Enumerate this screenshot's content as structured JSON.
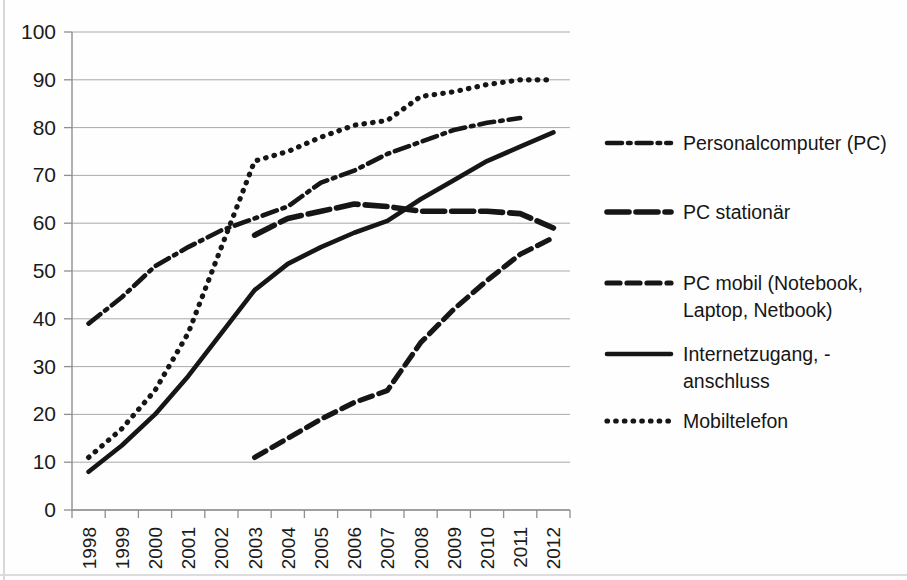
{
  "chart_data": {
    "type": "line",
    "title": "",
    "subtitle": "",
    "xlabel": "",
    "ylabel": "",
    "ylim": [
      0,
      100
    ],
    "ytick_labels": [
      "0",
      "10",
      "20",
      "30",
      "40",
      "50",
      "60",
      "70",
      "80",
      "90",
      "100"
    ],
    "ytick_values": [
      0,
      10,
      20,
      30,
      40,
      50,
      60,
      70,
      80,
      90,
      100
    ],
    "grid": true,
    "grid_axis": "y",
    "legend_position": "right",
    "categories": [
      "1998",
      "1999",
      "2000",
      "2001",
      "2002",
      "2003",
      "2004",
      "2005",
      "2006",
      "2007",
      "2008",
      "2009",
      "2010",
      "2011",
      "2012"
    ],
    "x": [
      1998,
      1999,
      2000,
      2001,
      2002,
      2003,
      2004,
      2005,
      2006,
      2007,
      2008,
      2009,
      2010,
      2011,
      2012
    ],
    "series": [
      {
        "name": "Personalcomputer (PC)",
        "style": "dash-dot",
        "color": "#161616",
        "values": [
          39,
          44.5,
          51,
          55,
          58.5,
          61,
          63.5,
          68.5,
          71,
          74.5,
          77,
          79.5,
          81,
          82,
          null
        ]
      },
      {
        "name": "PC stationär",
        "style": "solid-thick",
        "color": "#161616",
        "values": [
          null,
          null,
          null,
          null,
          null,
          57.5,
          61,
          62.5,
          64,
          63.5,
          62.5,
          62.5,
          62.5,
          62,
          59
        ]
      },
      {
        "name": "PC mobil (Notebook, Laptop, Netbook)",
        "style": "dashed",
        "color": "#161616",
        "values": [
          null,
          null,
          null,
          null,
          null,
          11,
          15,
          19,
          22.5,
          25,
          35,
          42,
          48,
          53.5,
          57
        ]
      },
      {
        "name": "Internetzugang, -anschluss",
        "style": "solid",
        "color": "#161616",
        "values": [
          8,
          13.5,
          20,
          28,
          37,
          46,
          51.5,
          55,
          58,
          60.5,
          65,
          69,
          73,
          76,
          79
        ]
      },
      {
        "name": "Mobiltelefon",
        "style": "dotted",
        "color": "#161616",
        "values": [
          11,
          17,
          25,
          37,
          55,
          73,
          75,
          78,
          80.5,
          81.5,
          86.5,
          87.5,
          89,
          90,
          90
        ]
      }
    ]
  },
  "legend": {
    "entries": [
      {
        "label": "Personalcomputer (PC)",
        "style": "dash-dot"
      },
      {
        "label": "PC stationär",
        "style": "solid-thick"
      },
      {
        "label_line1": "PC mobil (Notebook,",
        "label_line2": "Laptop, Netbook)",
        "style": "dashed"
      },
      {
        "label_line1": "Internetzugang, -",
        "label_line2": "anschluss",
        "style": "solid"
      },
      {
        "label": "Mobiltelefon",
        "style": "dotted"
      }
    ]
  }
}
